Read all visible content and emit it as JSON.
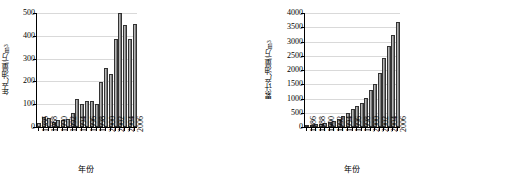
{
  "chart_data": [
    {
      "id": "annual",
      "type": "bar",
      "title": "",
      "xlabel": "年份",
      "ylabel": "年产油量/万m³",
      "ylabel_base": "年产油量/万m",
      "ylabel_sup": "3",
      "ylim": [
        0,
        500
      ],
      "ytick_step": 100,
      "yticks": [
        0,
        100,
        200,
        300,
        400,
        500
      ],
      "grid": true,
      "legend": "none",
      "categories": [
        1986,
        1987,
        1988,
        1989,
        1990,
        1991,
        1992,
        1993,
        1994,
        1995,
        1996,
        1997,
        1998,
        1999,
        2000,
        2001,
        2002,
        2003,
        2004,
        2005,
        2006
      ],
      "xtick_labels": [
        "1986",
        "1988",
        "1990",
        "1992",
        "1994",
        "1996",
        "1998",
        "2000",
        "2002",
        "2004",
        "2006"
      ],
      "values": [
        18,
        42,
        39,
        24,
        30,
        30,
        34,
        62,
        122,
        100,
        116,
        116,
        101,
        197,
        257,
        234,
        384,
        500,
        446,
        386,
        452
      ]
    },
    {
      "id": "cumulative",
      "type": "bar",
      "title": "",
      "xlabel": "年份",
      "ylabel": "累计产油量/万m³",
      "ylabel_base": "累计产油量/万m",
      "ylabel_sup": "3",
      "ylim": [
        0,
        4000
      ],
      "ytick_step": 500,
      "yticks": [
        0,
        500,
        1000,
        1500,
        2000,
        2500,
        3000,
        3500,
        4000
      ],
      "grid": true,
      "legend": "none",
      "categories": [
        1986,
        1987,
        1988,
        1989,
        1990,
        1991,
        1992,
        1993,
        1994,
        1995,
        1996,
        1997,
        1998,
        1999,
        2000,
        2001,
        2002,
        2003,
        2004,
        2005,
        2006
      ],
      "xtick_labels": [
        "1986",
        "1988",
        "1990",
        "1992",
        "1994",
        "1996",
        "1998",
        "2000",
        "2002",
        "2004",
        "2006"
      ],
      "values": [
        18,
        60,
        99,
        123,
        153,
        183,
        217,
        279,
        401,
        501,
        617,
        733,
        834,
        1031,
        1288,
        1522,
        1906,
        2406,
        2852,
        3238,
        3690
      ]
    }
  ]
}
